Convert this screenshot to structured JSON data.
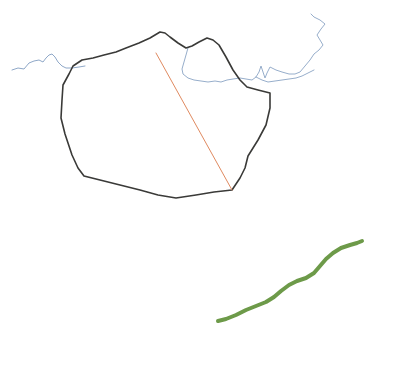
{
  "canvas": {
    "width": 394,
    "height": 368,
    "background_color": "#ffffff",
    "title": "Map Feature Sketch"
  },
  "layers": [
    {
      "id": "boundary-polygon",
      "name": "Dark boundary polygon",
      "kind": "polygon",
      "stroke_color": "#3a3a38",
      "stroke_width": 1.6,
      "fill": "none",
      "points": "160,32 150,38 139,43 126,48 116,52 104,55 93,58 82,60 73,66 69,74 63,85 62,100 61,118 65,134 72,155 78,168 84,176 100,180 120,185 140,190 158,195 176,198 196,195 214,192 232,190 240,178 245,168 248,156 258,140 266,125 270,108 270,93 258,90 247,87 240,80 233,70 226,57 219,45 213,40 207,38 199,42 192,46 186,48 178,43 170,37 165,33 160,32"
    },
    {
      "id": "hydrography-line",
      "name": "Blue hydrography / coastline polyline",
      "kind": "polyline",
      "stroke_color": "#8fa8c8",
      "stroke_width": 1.0,
      "fill": "none",
      "points": "12,70 18,68 24,69 29,63 34,61 39,60 43,62 46,58 49,55 52,54 55,57 58,62 62,66 66,68 72,68 79,67 85,66"
    },
    {
      "id": "hydrography-line-interior",
      "name": "Blue interior watercourse polyline",
      "kind": "polyline",
      "stroke_color": "#97aecb",
      "stroke_width": 1.0,
      "fill": "none",
      "points": "188,48 186,55 184,62 182,69 183,74 188,78 194,80 201,81 208,82 215,81 221,82 227,80 233,79 240,78 246,79 252,80 256,77 259,72 261,66 263,72 265,78 267,73 270,67 276,70 282,72 289,74 295,74 300,72 305,66 310,60 314,54 319,50 323,45 320,40 317,35 321,29 325,24 320,20 314,17 311,14"
    },
    {
      "id": "hydrography-line-east",
      "name": "Blue eastern branch polyline",
      "kind": "polyline",
      "stroke_color": "#97aecb",
      "stroke_width": 1.0,
      "fill": "none",
      "points": "256,77 262,80 268,82 275,81 282,80 289,79 296,78 302,76 308,73 314,70"
    },
    {
      "id": "transect-line",
      "name": "Orange transect line",
      "kind": "line",
      "stroke_color": "#e08a60",
      "stroke_width": 1.0,
      "fill": "none",
      "points": "156,53 232,190"
    },
    {
      "id": "vegetation-trace",
      "name": "Green wavy trace",
      "kind": "polyline",
      "stroke_color": "#6d9a49",
      "stroke_width": 4.0,
      "fill": "none",
      "points": "218,321 226,319 236,315 246,310 256,306 266,302 274,297 281,291 289,285 297,281 306,278 314,273 320,266 326,259 333,253 341,248 350,245 357,243 362,241"
    }
  ]
}
